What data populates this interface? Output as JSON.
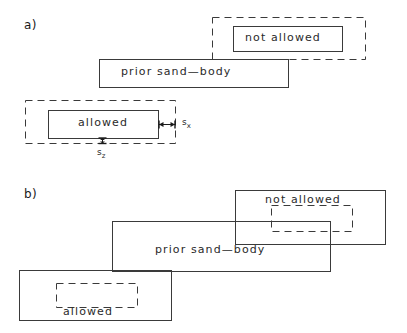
{
  "figure": {
    "title": "",
    "panels": [
      {
        "id": "a",
        "label": "a)",
        "description": "allowed and not-allowed placements of a new sand-body relative to a prior sand-body, with sx and sz separation margins",
        "shapes": [
          {
            "name": "not-allowed-margin",
            "style": "dashed",
            "x": 212,
            "y": 17,
            "w": 153,
            "h": 42
          },
          {
            "name": "not-allowed-body",
            "style": "solid",
            "x": 233,
            "y": 26,
            "w": 109,
            "h": 25
          },
          {
            "name": "prior-sand-body",
            "style": "solid",
            "x": 99,
            "y": 59,
            "w": 189,
            "h": 28
          },
          {
            "name": "allowed-margin",
            "style": "dashed",
            "x": 25,
            "y": 100,
            "w": 150,
            "h": 43
          },
          {
            "name": "allowed-body",
            "style": "solid",
            "x": 48,
            "y": 110,
            "w": 110,
            "h": 28
          }
        ],
        "labels": {
          "not_allowed": "not  allowed",
          "prior_sand_body": "prior  sand—body",
          "allowed": "allowed",
          "sx": "s",
          "sx_sub": "x",
          "sz": "s",
          "sz_sub": "z"
        }
      },
      {
        "id": "b",
        "label": "b)",
        "description": "overlapping case: not-allowed body overlaps prior sand-body; allowed body sits clear of it",
        "shapes": [
          {
            "name": "not-allowed-body",
            "style": "solid",
            "x": 235,
            "y": 190,
            "w": 150,
            "h": 54
          },
          {
            "name": "not-allowed-margin",
            "style": "dashed",
            "x": 271,
            "y": 205,
            "w": 81,
            "h": 26
          },
          {
            "name": "prior-sand-body",
            "style": "solid",
            "x": 112,
            "y": 221,
            "w": 218,
            "h": 50
          },
          {
            "name": "allowed-body",
            "style": "solid",
            "x": 19,
            "y": 270,
            "w": 152,
            "h": 50
          },
          {
            "name": "allowed-margin",
            "style": "dashed",
            "x": 56,
            "y": 283,
            "w": 81,
            "h": 24
          }
        ],
        "labels": {
          "not_allowed": "not  allowed",
          "prior_sand_body": "prior  sand—body",
          "allowed": "allowed"
        }
      }
    ],
    "colors": {
      "background": "#ffffff",
      "stroke": "#3a3a3a",
      "text": "#1a1a1a"
    }
  }
}
